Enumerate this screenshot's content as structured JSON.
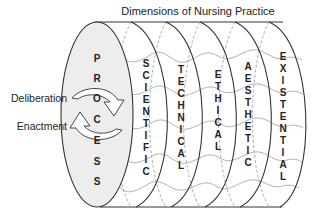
{
  "title": "Dimensions of Nursing Practice",
  "side_labels": {
    "deliberation": "Deliberation",
    "enactment": "Enactment"
  },
  "process": {
    "word": "PROCESS",
    "letters": [
      "P",
      "R",
      "O",
      "C",
      "E",
      "S",
      "S"
    ]
  },
  "dimensions": [
    {
      "name": "SCIENTIFIC",
      "letters": [
        "S",
        "C",
        "I",
        "E",
        "N",
        "T",
        "I",
        "F",
        "I",
        "C"
      ]
    },
    {
      "name": "TECHNICAL",
      "letters": [
        "T",
        "E",
        "C",
        "H",
        "N",
        "I",
        "C",
        "A",
        "L"
      ]
    },
    {
      "name": "ETHICAL",
      "letters": [
        "E",
        "T",
        "H",
        "I",
        "C",
        "A",
        "L"
      ]
    },
    {
      "name": "AESTHETIC",
      "letters": [
        "A",
        "E",
        "S",
        "T",
        "H",
        "E",
        "T",
        "I",
        "C"
      ]
    },
    {
      "name": "EXISTENTIAL",
      "letters": [
        "E",
        "X",
        "I",
        "S",
        "T",
        "E",
        "N",
        "T",
        "I",
        "A",
        "L"
      ]
    }
  ],
  "colors": {
    "line": "#333333",
    "wave": "#a8a8a8",
    "dashed": "#9a9a9a",
    "process_fill": "#ededed",
    "text": "#222222"
  }
}
